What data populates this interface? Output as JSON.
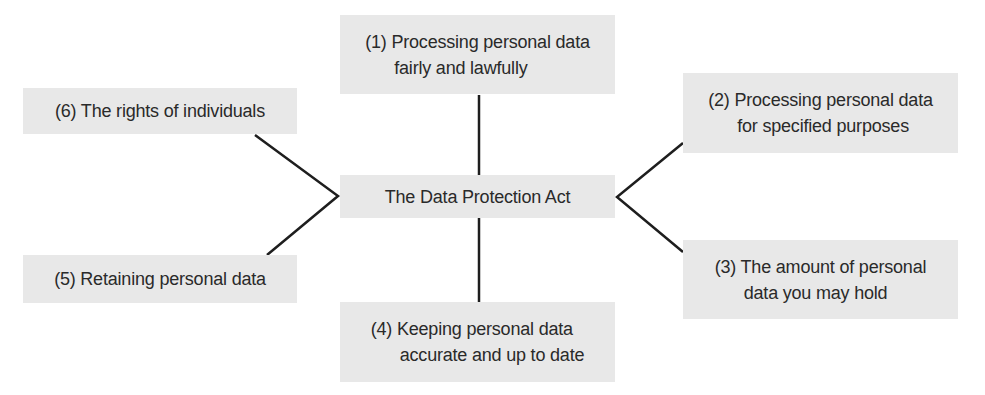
{
  "diagram": {
    "center": {
      "label": "The Data Protection Act"
    },
    "nodes": [
      {
        "id": 1,
        "line1": "(1) Processing personal data",
        "line2": "fairly and lawfully"
      },
      {
        "id": 2,
        "line1": "(2) Processing personal data",
        "line2": "for specified purposes"
      },
      {
        "id": 3,
        "line1": "(3) The amount of personal",
        "line2": "data you may hold"
      },
      {
        "id": 4,
        "line1": "(4) Keeping personal data",
        "line2": "accurate and up to date"
      },
      {
        "id": 5,
        "line1": "(5) Retaining personal data"
      },
      {
        "id": 6,
        "line1": "(6) The rights of individuals"
      }
    ],
    "colors": {
      "box_fill": "#e8e8e8",
      "line": "#1e1e1e",
      "text": "#2a2a2a"
    }
  }
}
